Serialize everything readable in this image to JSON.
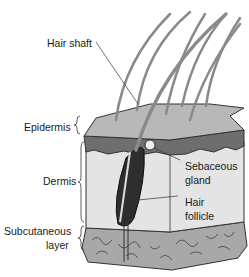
{
  "diagram": {
    "labels": {
      "hair_shaft": "Hair shaft",
      "epidermis": "Epidermis",
      "dermis": "Dermis",
      "subcutaneous_line1": "Subcutaneous",
      "subcutaneous_line2": "layer",
      "sebaceous_line1": "Sebaceous",
      "sebaceous_line2": "gland",
      "follicle_line1": "Hair",
      "follicle_line2": "follicle"
    },
    "colors": {
      "epidermis_top": "#b8b8b8",
      "epidermis_side": "#6e6e6e",
      "dermis": "#e4e4e4",
      "subcutaneous": "#a8a8a8",
      "follicle": "#2e2e2e",
      "hair": "#8a8a8a"
    }
  }
}
